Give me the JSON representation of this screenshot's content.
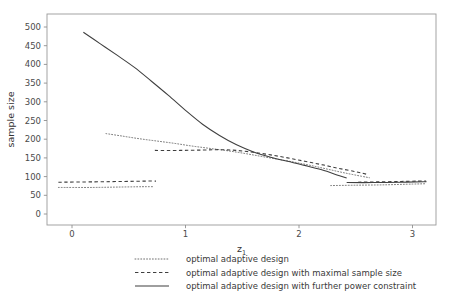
{
  "chart_data": {
    "type": "line",
    "title": "",
    "xlabel": "z1",
    "xlabel_main": "z",
    "xlabel_sub": "1",
    "ylabel": "sample size",
    "xlim": [
      -0.18,
      3.22
    ],
    "ylim": [
      -18,
      524
    ],
    "xticks": [
      0,
      1,
      2,
      3
    ],
    "xtick_labels": [
      "0",
      "1",
      "2",
      "3"
    ],
    "yticks": [
      0,
      50,
      100,
      150,
      200,
      250,
      300,
      350,
      400,
      450,
      500
    ],
    "ytick_labels": [
      "0",
      "50",
      "100",
      "150",
      "200",
      "250",
      "300",
      "350",
      "400",
      "450",
      "500"
    ],
    "grid": false,
    "legend_position": "bottom",
    "series": [
      {
        "name": "optimal adaptive design",
        "style": "dotted",
        "color": "#707070",
        "segments": [
          {
            "comment": "lower-left futility plateau",
            "points": [
              [
                -0.12,
                71
              ],
              [
                0.18,
                71
              ],
              [
                0.4,
                72
              ],
              [
                0.62,
                73
              ],
              [
                0.72,
                73
              ]
            ]
          },
          {
            "comment": "main descending branch",
            "points": [
              [
                0.3,
                215
              ],
              [
                0.45,
                208
              ],
              [
                0.6,
                201
              ],
              [
                0.75,
                195
              ],
              [
                0.9,
                189
              ],
              [
                1.05,
                182
              ],
              [
                1.2,
                176
              ],
              [
                1.35,
                170
              ],
              [
                1.5,
                163
              ],
              [
                1.65,
                155
              ],
              [
                1.8,
                147
              ],
              [
                1.95,
                139
              ],
              [
                2.1,
                130
              ],
              [
                2.25,
                120
              ],
              [
                2.4,
                110
              ],
              [
                2.55,
                101
              ],
              [
                2.62,
                97
              ]
            ]
          },
          {
            "comment": "right-hand plateau",
            "points": [
              [
                2.28,
                76
              ],
              [
                2.5,
                77
              ],
              [
                2.75,
                78
              ],
              [
                3.0,
                80
              ],
              [
                3.12,
                81
              ]
            ]
          }
        ]
      },
      {
        "name": "optimal adaptive design with maximal sample size",
        "style": "dashed",
        "color": "#3f3f3f",
        "segments": [
          {
            "comment": "lower-left futility plateau",
            "points": [
              [
                -0.12,
                85
              ],
              [
                0.2,
                86
              ],
              [
                0.45,
                87
              ],
              [
                0.65,
                88
              ],
              [
                0.74,
                88
              ]
            ]
          },
          {
            "comment": "capped plateau then descent",
            "points": [
              [
                0.73,
                170
              ],
              [
                0.95,
                170
              ],
              [
                1.15,
                171
              ],
              [
                1.3,
                172
              ],
              [
                1.45,
                170
              ],
              [
                1.6,
                165
              ],
              [
                1.75,
                158
              ],
              [
                1.9,
                150
              ],
              [
                2.05,
                141
              ],
              [
                2.2,
                132
              ],
              [
                2.35,
                122
              ],
              [
                2.5,
                113
              ],
              [
                2.6,
                106
              ]
            ]
          },
          {
            "comment": "right-hand plateau",
            "points": [
              [
                2.52,
                85
              ],
              [
                2.7,
                86
              ],
              [
                2.9,
                87
              ],
              [
                3.05,
                88
              ],
              [
                3.12,
                88
              ]
            ]
          }
        ]
      },
      {
        "name": "optimal adaptive design with further power constraint",
        "style": "solid",
        "color": "#3f3f3f",
        "segments": [
          {
            "comment": "steep descent from high N",
            "points": [
              [
                0.1,
                486
              ],
              [
                0.25,
                455
              ],
              [
                0.4,
                424
              ],
              [
                0.55,
                392
              ],
              [
                0.7,
                355
              ],
              [
                0.85,
                317
              ],
              [
                1.0,
                277
              ],
              [
                1.15,
                240
              ],
              [
                1.3,
                210
              ],
              [
                1.45,
                185
              ],
              [
                1.6,
                166
              ],
              [
                1.75,
                152
              ],
              [
                1.9,
                141
              ],
              [
                2.05,
                130
              ],
              [
                2.2,
                118
              ],
              [
                2.35,
                103
              ],
              [
                2.42,
                96
              ]
            ]
          },
          {
            "comment": "right-hand plateau",
            "points": [
              [
                2.42,
                84
              ],
              [
                2.65,
                84
              ],
              [
                2.9,
                85
              ],
              [
                3.1,
                86
              ],
              [
                3.12,
                86
              ]
            ]
          }
        ]
      }
    ]
  },
  "legend": {
    "entries": [
      {
        "label": "optimal adaptive design",
        "style": "dotted"
      },
      {
        "label": "optimal adaptive design with maximal sample size",
        "style": "dashed"
      },
      {
        "label": "optimal adaptive design with further power constraint",
        "style": "solid"
      }
    ]
  }
}
